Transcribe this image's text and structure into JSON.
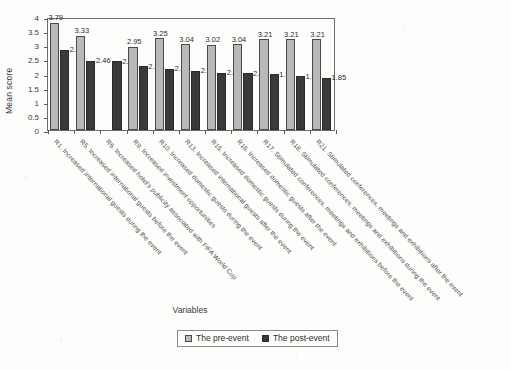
{
  "chart_data": {
    "type": "bar",
    "title": "",
    "xlabel": "Variables",
    "ylabel": "Mean score",
    "ylim": [
      0,
      4
    ],
    "yticks": [
      "0",
      "0.5",
      "1",
      "1.5",
      "2",
      "2.5",
      "3",
      "3.5",
      "4"
    ],
    "grid": false,
    "legend_position": "bottom",
    "categories": [
      "R1",
      "R5",
      "R6",
      "R9",
      "R10",
      "R13",
      "R15",
      "R16",
      "R17",
      "R18",
      "R21"
    ],
    "category_labels": [
      "R1. Increased international guests during the event",
      "R5. Increased international guests before the event",
      "R6. Increased hotel's publicity associated with FIFA World Cup",
      "R9. Increased investment opportunities",
      "R10. Increased domestic guests during the event",
      "R13. Increased international guests after the event",
      "R15. Increased domestic guests during the event",
      "R16. Increased domestic guests after the event",
      "R17. Stimulated conferences, meetings and exhibitions before the event",
      "R18. Stimulated conferences, meetings and exhibitions during the event",
      "R21. Stimulated conferences, meetings and exhibitions after the event"
    ],
    "series": [
      {
        "name": "The pre-event",
        "color": "#b9b9b9",
        "values": [
          3.79,
          3.33,
          null,
          2.95,
          3.25,
          3.04,
          3.02,
          3.04,
          3.21,
          3.21,
          3.21
        ],
        "labels": [
          "3.79",
          "3.33",
          "",
          "2.95",
          "3.25",
          "3.04",
          "3.02",
          "3.04",
          "3.21",
          "3.21",
          "3.21"
        ]
      },
      {
        "name": "The post-event",
        "color": "#3a3a3a",
        "values": [
          2.84,
          2.46,
          2.43,
          2.26,
          2.17,
          2.1,
          2.02,
          2.01,
          1.97,
          1.91,
          1.85
        ],
        "labels": [
          "2.84",
          "2.46",
          "2.43",
          "2.26",
          "2.17",
          "2.1",
          "2.02",
          "2.01",
          "1.97",
          "1.91",
          "1.85"
        ]
      }
    ]
  },
  "legend": {
    "items": [
      {
        "label": "The pre-event"
      },
      {
        "label": "The post-event"
      }
    ]
  }
}
